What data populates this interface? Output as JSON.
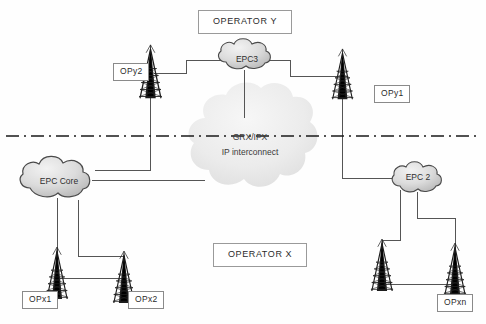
{
  "diagram": {
    "title_top": "OPERATOR Y",
    "title_bottom": "OPERATOR X",
    "clouds": {
      "epc3": "EPC3",
      "epc_core": "EPC Core",
      "epc2": "EPC 2",
      "interconnect_line1": "GRX/IPX",
      "interconnect_line2": "IP interconnect"
    },
    "towers": {
      "opy2": "OPy2",
      "opy1": "OPy1",
      "opx1": "OPx1",
      "opx2": "OPx2",
      "opxn": "OPxn"
    },
    "colors": {
      "line": "#555555",
      "divider": "#1a1a1a",
      "cloud_fill": "#d9d9d9",
      "cloud_stroke": "#4a4a4a",
      "interconnect_fill": "#ededed",
      "text": "#2b2b2b",
      "box_border": "#8a8a8a",
      "background": "#fefefe"
    }
  }
}
